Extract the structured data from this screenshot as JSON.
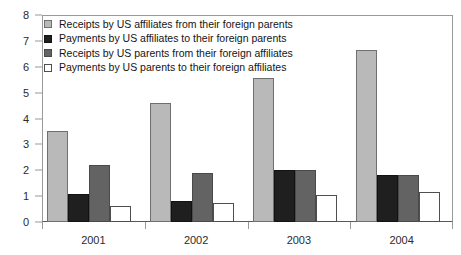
{
  "chart_data": {
    "type": "bar",
    "title": "",
    "subtitle": "",
    "xlabel": "",
    "ylabel": "",
    "categories": [
      "2001",
      "2002",
      "2003",
      "2004"
    ],
    "ylim": [
      0,
      8
    ],
    "yticks": [
      0,
      1,
      2,
      3,
      4,
      5,
      6,
      7,
      8
    ],
    "ytick_labels": [
      "0",
      "1",
      "2",
      "3",
      "4",
      "5",
      "6",
      "7",
      "8"
    ],
    "grid": false,
    "legend_position": "top-left",
    "series": [
      {
        "name": "Receipts by US affiliates from their foreign parents",
        "color": "#b9b9b9",
        "values": [
          3.5,
          4.6,
          5.55,
          6.65
        ]
      },
      {
        "name": "Payments by US affiliates to their foreign parents",
        "color": "#201f1f",
        "values": [
          1.1,
          0.8,
          2.0,
          1.8
        ]
      },
      {
        "name": "Receipts by US parents from their foreign affiliates",
        "color": "#636363",
        "values": [
          2.2,
          1.9,
          2.0,
          1.8
        ]
      },
      {
        "name": "Payments by US parents to their foreign affiliates",
        "color": "#ffffff",
        "values": [
          0.6,
          0.75,
          1.05,
          1.15
        ]
      }
    ]
  }
}
